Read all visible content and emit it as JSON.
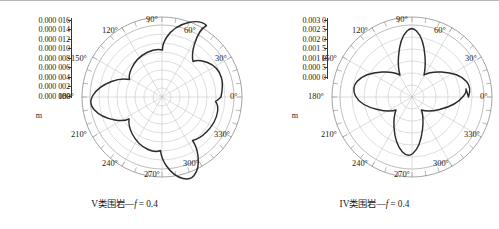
{
  "figure": {
    "panels": [
      {
        "id": "left",
        "caption_prefix": "V类围岩—",
        "caption_var": "f",
        "caption_suffix": "= 0.4",
        "caption_full": "V类围岩—f = 0.4",
        "unit": "m",
        "radial_ticks": [
          "0.000 016",
          "0.000 014",
          "0.000 012",
          "0.000 010",
          "0.000 008",
          "0.000 006",
          "0.000 004",
          "0.000 002",
          "0.000 000"
        ],
        "angle_ticks": [
          "0°",
          "30°",
          "60°",
          "90°",
          "120°",
          "150°",
          "180°",
          "210°",
          "240°",
          "270°",
          "300°",
          "330°"
        ]
      },
      {
        "id": "right",
        "caption_prefix": "IV类围岩—",
        "caption_var": "f",
        "caption_suffix": "= 0.4",
        "caption_full": "IV类围岩—f = 0.4",
        "unit": "m",
        "radial_ticks": [
          "0.003 0",
          "0.002 5",
          "0.002 0",
          "0.001 5",
          "0.001 0",
          "0.000 5",
          "0.000 0"
        ],
        "angle_ticks": [
          "0°",
          "30°",
          "60°",
          "90°",
          "120°",
          "150°",
          "180°",
          "210°",
          "240°",
          "270°",
          "300°",
          "330°"
        ]
      }
    ],
    "colors": {
      "curve": "#2b2b2b",
      "grid": "#b5b5b5",
      "outer_circle": "#8d8d8d",
      "text": "#1a1a1a"
    }
  },
  "chart_data": [
    {
      "type": "line",
      "subtype": "polar",
      "title": "V类围岩—f = 0.4",
      "xlabel": "",
      "ylabel": "m",
      "rlim": [
        0.0,
        1.6e-05
      ],
      "rticks": [
        0.0,
        2e-06,
        4e-06,
        6e-06,
        8e-06,
        1e-05,
        1.2e-05,
        1.4e-05,
        1.6e-05
      ],
      "rtick_labels": [
        "0.000 000",
        "0.000 002",
        "0.000 004",
        "0.000 006",
        "0.000 008",
        "0.000 010",
        "0.000 012",
        "0.000 014",
        "0.000 016"
      ],
      "theta_ticks_deg": [
        0,
        30,
        60,
        90,
        120,
        150,
        180,
        210,
        240,
        270,
        300,
        330
      ],
      "theta_tick_labels": [
        "0°",
        "30°",
        "60°",
        "90°",
        "120°",
        "150°",
        "180°",
        "210°",
        "240°",
        "270°",
        "300°",
        "330°"
      ],
      "grid": true,
      "legend": "none",
      "series": [
        {
          "name": "V类围岩 f=0.4 位移",
          "theta_deg": [
            0,
            5,
            10,
            15,
            20,
            25,
            30,
            35,
            40,
            45,
            50,
            55,
            60,
            65,
            70,
            75,
            80,
            85,
            90,
            95,
            100,
            105,
            110,
            115,
            120,
            125,
            130,
            135,
            140,
            145,
            150,
            155,
            160,
            165,
            170,
            175,
            180,
            185,
            190,
            195,
            200,
            205,
            210,
            215,
            220,
            225,
            230,
            235,
            240,
            245,
            250,
            255,
            260,
            265,
            270,
            275,
            280,
            285,
            290,
            295,
            300,
            305,
            310,
            315,
            320,
            325,
            330,
            335,
            340,
            345,
            350,
            355,
            360
          ],
          "r": [
            1.18e-05,
            1.21e-05,
            1.23e-05,
            1.23e-05,
            1.21e-05,
            1.17e-05,
            1.11e-05,
            1.02e-05,
            9.1e-06,
            7.9e-06,
            7e-06,
            6.7e-06,
            7e-06,
            7.9e-06,
            9.1e-06,
            1.03e-05,
            1.12e-05,
            1.18e-05,
            1.21e-05,
            1.21e-05,
            1.18e-05,
            1.12e-05,
            1.03e-05,
            9.2e-06,
            8e-06,
            7.1e-06,
            6.7e-06,
            6.9e-06,
            7.7e-06,
            8.9e-06,
            1.01e-05,
            1.1e-05,
            1.17e-05,
            1.21e-05,
            1.23e-05,
            1.23e-05,
            1.21e-05,
            1.16e-05,
            1.08e-05,
            9.8e-06,
            8.6e-06,
            7.5e-06,
            6.8e-06,
            6.7e-06,
            7.1e-06,
            8e-06,
            9.1e-06,
            1.02e-05,
            1.1e-05,
            1.16e-05,
            1.19e-05,
            1.2e-05,
            1.19e-05,
            1.16e-05,
            1.11e-05,
            1.03e-05,
            9.3e-06,
            8.2e-06,
            7.3e-06,
            6.8e-06,
            6.7e-06,
            7.1e-06,
            7.9e-06,
            8.9e-06,
            9.9e-06,
            1.07e-05,
            1.13e-05,
            1.17e-05,
            1.19e-05,
            1.2e-05,
            1.2e-05,
            1.19e-05,
            1.18e-05
          ]
        }
      ]
    },
    {
      "type": "line",
      "subtype": "polar",
      "title": "IV类围岩—f = 0.4",
      "xlabel": "",
      "ylabel": "m",
      "rlim": [
        0.0,
        0.003
      ],
      "rticks": [
        0.0,
        0.0005,
        0.001,
        0.0015,
        0.002,
        0.0025,
        0.003
      ],
      "rtick_labels": [
        "0.000 0",
        "0.000 5",
        "0.001 0",
        "0.001 5",
        "0.002 0",
        "0.002 5",
        "0.003 0"
      ],
      "theta_ticks_deg": [
        0,
        30,
        60,
        90,
        120,
        150,
        180,
        210,
        240,
        270,
        300,
        330
      ],
      "theta_tick_labels": [
        "0°",
        "30°",
        "60°",
        "90°",
        "120°",
        "150°",
        "180°",
        "210°",
        "240°",
        "270°",
        "300°",
        "330°"
      ],
      "grid": true,
      "legend": "none",
      "series": [
        {
          "name": "IV类围岩 f=0.4 位移",
          "theta_deg": [
            0,
            5,
            10,
            15,
            20,
            25,
            30,
            35,
            40,
            45,
            50,
            55,
            60,
            65,
            70,
            75,
            80,
            85,
            90,
            95,
            100,
            105,
            110,
            115,
            120,
            125,
            130,
            135,
            140,
            145,
            150,
            155,
            160,
            165,
            170,
            175,
            180,
            185,
            190,
            195,
            200,
            205,
            210,
            215,
            220,
            225,
            230,
            235,
            240,
            245,
            250,
            255,
            260,
            265,
            270,
            275,
            280,
            285,
            290,
            295,
            300,
            305,
            310,
            315,
            320,
            325,
            330,
            335,
            340,
            345,
            350,
            355,
            360
          ],
          "r": [
            0.00212,
            0.0021,
            0.00204,
            0.00193,
            0.00176,
            0.00152,
            0.00124,
            0.00096,
            0.00072,
            0.00055,
            0.00046,
            0.00046,
            0.00055,
            0.00074,
            0.001,
            0.0013,
            0.00159,
            0.00182,
            0.00195,
            0.00196,
            0.00186,
            0.00167,
            0.00142,
            0.00115,
            0.00089,
            0.00067,
            0.00052,
            0.00046,
            0.0005,
            0.00064,
            0.00087,
            0.00117,
            0.0015,
            0.0018,
            0.00202,
            0.00213,
            0.00215,
            0.00211,
            0.002,
            0.00182,
            0.00157,
            0.00128,
            0.00099,
            0.00074,
            0.00056,
            0.00046,
            0.00046,
            0.00056,
            0.00075,
            0.00102,
            0.00133,
            0.00163,
            0.00186,
            0.00198,
            0.002,
            0.00192,
            0.00175,
            0.0015,
            0.00122,
            0.00094,
            0.0007,
            0.00053,
            0.00046,
            0.00049,
            0.00062,
            0.00084,
            0.00113,
            0.00146,
            0.00176,
            0.00198,
            0.0021,
            0.00213,
            0.00212
          ]
        }
      ]
    }
  ]
}
